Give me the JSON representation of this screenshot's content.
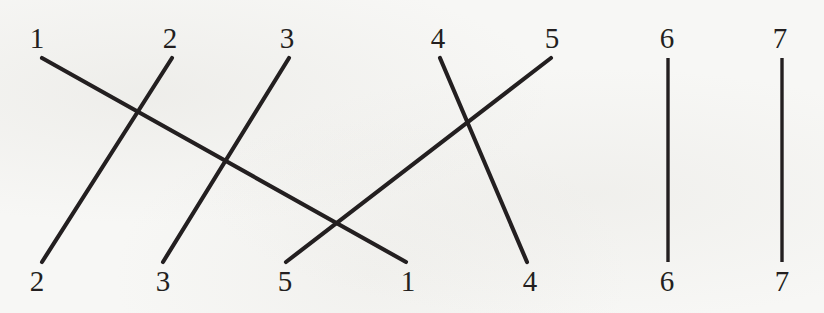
{
  "diagram": {
    "kind": "permutation-wiring-diagram",
    "strand_count": 7,
    "colors": {
      "background": "#f7f7f5",
      "ink": "#231f20"
    },
    "top_labels": [
      {
        "text": "1",
        "x": 37,
        "y": 38
      },
      {
        "text": "2",
        "x": 170,
        "y": 38
      },
      {
        "text": "3",
        "x": 287,
        "y": 38
      },
      {
        "text": "4",
        "x": 438,
        "y": 38
      },
      {
        "text": "5",
        "x": 552,
        "y": 38
      },
      {
        "text": "6",
        "x": 667,
        "y": 38
      },
      {
        "text": "7",
        "x": 780,
        "y": 38
      }
    ],
    "bottom_labels": [
      {
        "text": "2",
        "x": 37,
        "y": 281
      },
      {
        "text": "3",
        "x": 163,
        "y": 281
      },
      {
        "text": "5",
        "x": 285,
        "y": 281
      },
      {
        "text": "1",
        "x": 408,
        "y": 281
      },
      {
        "text": "4",
        "x": 530,
        "y": 281
      },
      {
        "text": "6",
        "x": 667,
        "y": 281
      },
      {
        "text": "7",
        "x": 782,
        "y": 281
      }
    ],
    "strands": [
      {
        "name": "strand-1",
        "from": "1",
        "to": "1",
        "x1": 42,
        "y1": 58,
        "x2": 406,
        "y2": 262,
        "vertical": false
      },
      {
        "name": "strand-2",
        "from": "2",
        "to": "2",
        "x1": 172,
        "y1": 58,
        "x2": 42,
        "y2": 262,
        "vertical": false
      },
      {
        "name": "strand-3",
        "from": "3",
        "to": "3",
        "x1": 289,
        "y1": 58,
        "x2": 163,
        "y2": 262,
        "vertical": false
      },
      {
        "name": "strand-4",
        "from": "4",
        "to": "4",
        "x1": 440,
        "y1": 58,
        "x2": 527,
        "y2": 262,
        "vertical": false
      },
      {
        "name": "strand-5",
        "from": "5",
        "to": "5",
        "x1": 551,
        "y1": 58,
        "x2": 286,
        "y2": 262,
        "vertical": false
      },
      {
        "name": "strand-6",
        "from": "6",
        "to": "6",
        "x1": 668,
        "y1": 58,
        "x2": 668,
        "y2": 262,
        "vertical": true
      },
      {
        "name": "strand-7",
        "from": "7",
        "to": "7",
        "x1": 782,
        "y1": 58,
        "x2": 782,
        "y2": 262,
        "vertical": true
      }
    ],
    "crossings": [
      {
        "x": 134,
        "y": 110
      },
      {
        "x": 231,
        "y": 155
      },
      {
        "x": 337,
        "y": 223
      },
      {
        "x": 468,
        "y": 123
      }
    ]
  }
}
